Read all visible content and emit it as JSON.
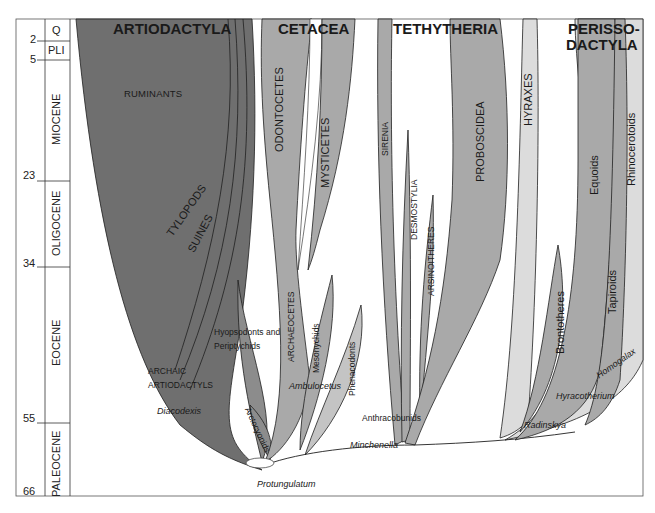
{
  "timescale": {
    "ages": [
      "2",
      "5",
      "23",
      "34",
      "55",
      "66"
    ],
    "epochs": [
      "Q",
      "PLI",
      "MIOCENE",
      "OLIGOCENE",
      "EOCENE",
      "PALEOCENE"
    ]
  },
  "groups": {
    "artiodactyla": "ARTIODACTYLA",
    "cetacea": "CETACEA",
    "tethytheria": "TETHYTHERIA",
    "perisso_line1": "PERISSO-",
    "perisso_line2": "DACTYLA"
  },
  "lineages": {
    "ruminants": "RUMINANTS",
    "tylopods": "TYLOPODS",
    "suines": "SUINES",
    "odontocetes": "ODONTOCETES",
    "mysticetes": "MYSTICETES",
    "archaeocetes": "ARCHAEOCETES",
    "mesonychids": "Mesonychids",
    "phenacodonts": "Phenacodonts",
    "arctocyonids": "Arctocyonids",
    "sirenia": "SIRENIA",
    "desmostylia": "DESMOSTYLIA",
    "arsinoitheres": "ARSINOITHERES",
    "proboscidea": "PROBOSCIDEA",
    "hyraxes": "HYRAXES",
    "brontotheres": "Brontotheres",
    "equoids": "Equoids",
    "tapiroids": "Tapiroids",
    "rhinocerotoids": "Rhinocerotoids",
    "hyopsodonts_line1": "Hyopsodonts and",
    "hyopsodonts_line2": "Periptychids",
    "archaic_line1": "ARCHAIC",
    "archaic_line2": "ARTIODACTYLS",
    "anthracobunids": "Anthracobunids"
  },
  "taxa": {
    "diacodexis": "Diacodexis",
    "ambulocetus": "Ambulocetus",
    "protungulatum": "Protungulatum",
    "minchenella": "Minchenella",
    "radinskya": "Radinskya",
    "hyracotherium": "Hyracotherium",
    "homogalax": "Homogalax"
  },
  "colors": {
    "artiodactyla_fill": "#6f6f6f",
    "medium_fill": "#a9a9a9",
    "light_fill": "#d9d9d9",
    "outline": "#1f1f1f",
    "background": "#ffffff"
  }
}
